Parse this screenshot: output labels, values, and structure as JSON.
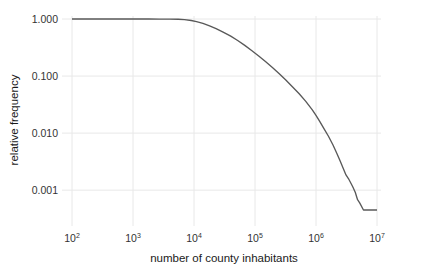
{
  "chart_data": {
    "type": "line",
    "title": "",
    "subtitle": "",
    "xlabel": "number of county inhabitants",
    "ylabel": "relative frequency",
    "xscale": "log",
    "yscale": "log",
    "xlim": [
      100,
      10000000
    ],
    "ylim": [
      0.0003,
      1.0
    ],
    "grid": true,
    "legend": null,
    "legend_position": "none",
    "line_color": "#595959",
    "grid_color": "#e8e8e8",
    "x_ticks": [
      {
        "value": 100,
        "mantissa": "10",
        "exponent": "2"
      },
      {
        "value": 1000,
        "mantissa": "10",
        "exponent": "3"
      },
      {
        "value": 10000,
        "mantissa": "10",
        "exponent": "4"
      },
      {
        "value": 100000,
        "mantissa": "10",
        "exponent": "5"
      },
      {
        "value": 1000000,
        "mantissa": "10",
        "exponent": "6"
      },
      {
        "value": 10000000,
        "mantissa": "10",
        "exponent": "7"
      }
    ],
    "y_ticks": [
      {
        "value": 1.0,
        "label": "1.000"
      },
      {
        "value": 0.1,
        "label": "0.100"
      },
      {
        "value": 0.01,
        "label": "0.010"
      },
      {
        "value": 0.001,
        "label": "0.001"
      }
    ],
    "series": [
      {
        "name": "complementary cumulative distribution",
        "x": [
          100,
          150,
          230,
          350,
          530,
          800,
          1200,
          1800,
          2700,
          4000,
          5500,
          7000,
          9000,
          11000,
          14000,
          18000,
          23000,
          30000,
          40000,
          52000,
          68000,
          88000,
          115000,
          150000,
          195000,
          250000,
          320000,
          410000,
          530000,
          680000,
          870000,
          1000000,
          1150000,
          1350000,
          1600000,
          1900000,
          2200000,
          2500000,
          2800000,
          3100000,
          3400000,
          3700000,
          4000000,
          4400000,
          4800000,
          5200000,
          6000000,
          7500000,
          10000000
        ],
        "y": [
          1.0,
          1.0,
          1.0,
          1.0,
          1.0,
          1.0,
          1.0,
          0.999,
          0.998,
          0.995,
          0.99,
          0.975,
          0.94,
          0.9,
          0.84,
          0.76,
          0.68,
          0.59,
          0.5,
          0.42,
          0.345,
          0.28,
          0.225,
          0.178,
          0.14,
          0.11,
          0.085,
          0.065,
          0.049,
          0.036,
          0.0255,
          0.0205,
          0.016,
          0.012,
          0.0088,
          0.0062,
          0.0044,
          0.0032,
          0.0024,
          0.00185,
          0.0016,
          0.00135,
          0.00115,
          0.00092,
          0.00068,
          0.0006,
          0.00045,
          0.00045,
          0.00045
        ]
      }
    ]
  }
}
